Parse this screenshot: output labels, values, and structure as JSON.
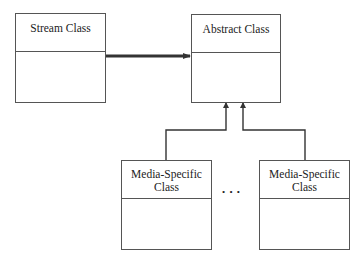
{
  "diagram": {
    "classes": {
      "stream": {
        "name": "Stream Class"
      },
      "abstract": {
        "name": "Abstract Class"
      },
      "media_left": {
        "name_line1": "Media-Specific",
        "name_line2": "Class"
      },
      "media_right": {
        "name_line1": "Media-Specific",
        "name_line2": "Class"
      }
    },
    "ellipsis": "• • •",
    "relationships": [
      {
        "from": "Stream Class",
        "to": "Abstract Class",
        "type": "association",
        "style": "thick-arrow"
      },
      {
        "from": "Media-Specific Class (left)",
        "to": "Abstract Class",
        "type": "inheritance"
      },
      {
        "from": "Media-Specific Class (right)",
        "to": "Abstract Class",
        "type": "inheritance"
      }
    ],
    "colors": {
      "line": "#333333",
      "border": "#555555",
      "background": "#ffffff"
    }
  }
}
